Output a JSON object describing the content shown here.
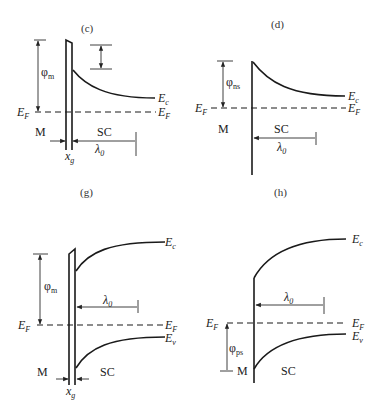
{
  "figure": {
    "type": "energy-band-diagrams",
    "panels": [
      {
        "id": "c",
        "label": "(c)",
        "barrier_label": "φ",
        "barrier_sub": "m",
        "fermi_left": "E",
        "fermi_left_sub": "F",
        "fermi_right": "E",
        "fermi_right_sub": "F",
        "ec_label": "E",
        "ec_sub": "c",
        "metal_label": "M",
        "semi_label": "SC",
        "lambda_label": "λ",
        "lambda_sub": "0",
        "gap_label": "x",
        "gap_sub": "g"
      },
      {
        "id": "d",
        "label": "(d)",
        "barrier_label": "φ",
        "barrier_sub": "ns",
        "fermi_left": "E",
        "fermi_left_sub": "F",
        "fermi_right": "E",
        "fermi_right_sub": "F",
        "ec_label": "E",
        "ec_sub": "c",
        "metal_label": "M",
        "semi_label": "SC",
        "lambda_label": "λ",
        "lambda_sub": "0"
      },
      {
        "id": "g",
        "label": "(g)",
        "barrier_label": "φ",
        "barrier_sub": "m",
        "fermi_left": "E",
        "fermi_left_sub": "F",
        "fermi_right": "E",
        "fermi_right_sub": "F",
        "ec_label": "E",
        "ec_sub": "c",
        "ev_label": "E",
        "ev_sub": "v",
        "metal_label": "M",
        "semi_label": "SC",
        "lambda_label": "λ",
        "lambda_sub": "0",
        "gap_label": "x",
        "gap_sub": "g"
      },
      {
        "id": "h",
        "label": "(h)",
        "barrier_label": "φ",
        "barrier_sub": "ps",
        "fermi_left": "E",
        "fermi_left_sub": "F",
        "fermi_right": "E",
        "fermi_right_sub": "F",
        "ec_label": "E",
        "ec_sub": "c",
        "ev_label": "E",
        "ev_sub": "v",
        "metal_label": "M",
        "semi_label": "SC",
        "lambda_label": "λ",
        "lambda_sub": "0"
      }
    ]
  }
}
